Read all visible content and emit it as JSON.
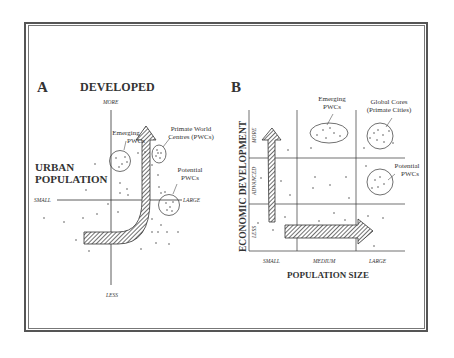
{
  "panel_a": {
    "letter": "A",
    "title": "DEVELOPED",
    "y_top_label": "MORE",
    "y_bottom_label": "LESS",
    "x_left_label": "SMALL",
    "x_right_label": "LARGE",
    "axis_title_line1": "URBAN",
    "axis_title_line2": "POPULATION",
    "annotations": {
      "emerging_line1": "Emerging",
      "emerging_line2": "PWCs",
      "primate_line1": "Primate World",
      "primate_line2": "Centres (PWCs)",
      "potential_line1": "Potential",
      "potential_line2": "PWCs"
    }
  },
  "panel_b": {
    "letter": "B",
    "y_axis_title": "ECONOMIC DEVELOPMENT",
    "y_labels": [
      "LESS",
      "ADVANCED",
      "MORE"
    ],
    "x_labels": [
      "SMALL",
      "MEDIUM",
      "LARGE"
    ],
    "x_axis_title": "POPULATION SIZE",
    "annotations": {
      "emerging_line1": "Emerging",
      "emerging_line2": "PWCs",
      "global_line1": "Global Cores",
      "global_line2": "(Primate Cities)",
      "potential_line1": "Potential",
      "potential_line2": "PWCs"
    }
  },
  "colors": {
    "ink": "#333333",
    "frame": "#555555",
    "background": "#ffffff"
  }
}
